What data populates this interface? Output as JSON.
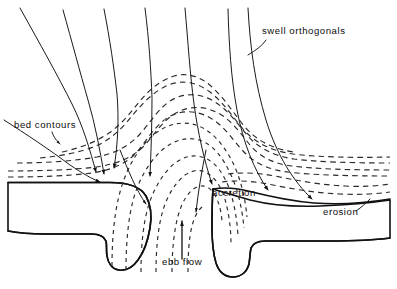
{
  "figure": {
    "type": "line-diagram",
    "background_color": "#ffffff",
    "ink_color": "#111111",
    "width": 397,
    "height": 289
  },
  "labels": {
    "swell_orthogonals": "swell orthogonals",
    "bed_contours": "bed contours",
    "ebb_flow": "ebb flow",
    "accretion": "accretion",
    "erosion": "erosion"
  },
  "legend_items": [
    {
      "key": "swell_orthogonals",
      "text": "swell orthogonals",
      "line_style": "solid",
      "meaning": "wave ray direction"
    },
    {
      "key": "bed_contours",
      "text": "bed contours",
      "line_style": "dashed",
      "meaning": "seabed depth contour"
    },
    {
      "key": "ebb_flow",
      "text": "ebb flow",
      "line_style": "arrow",
      "meaning": "seaward tidal current"
    },
    {
      "key": "accretion",
      "text": "accretion",
      "line_style": "text",
      "meaning": "shoreline build-out"
    },
    {
      "key": "erosion",
      "text": "erosion",
      "line_style": "text",
      "meaning": "shoreline retreat"
    }
  ],
  "annotations": {
    "swell_orthogonals": {
      "x": 262,
      "y": 34,
      "anchor": "start",
      "leader": true
    },
    "bed_contours": {
      "x": 14,
      "y": 128,
      "anchor": "start",
      "leader": true
    },
    "ebb_flow": {
      "x": 162,
      "y": 265,
      "anchor": "start",
      "leader": false
    },
    "accretion": {
      "x": 212,
      "y": 196,
      "anchor": "start",
      "leader": false
    },
    "erosion": {
      "x": 323,
      "y": 215,
      "anchor": "start",
      "leader": true
    }
  },
  "features": {
    "orthogonal_count": 7,
    "contour_count": 8,
    "landmass_count": 2,
    "channel_label": "ebb flow",
    "shoreline_left_state": "accretion",
    "shoreline_right_state": "erosion"
  }
}
